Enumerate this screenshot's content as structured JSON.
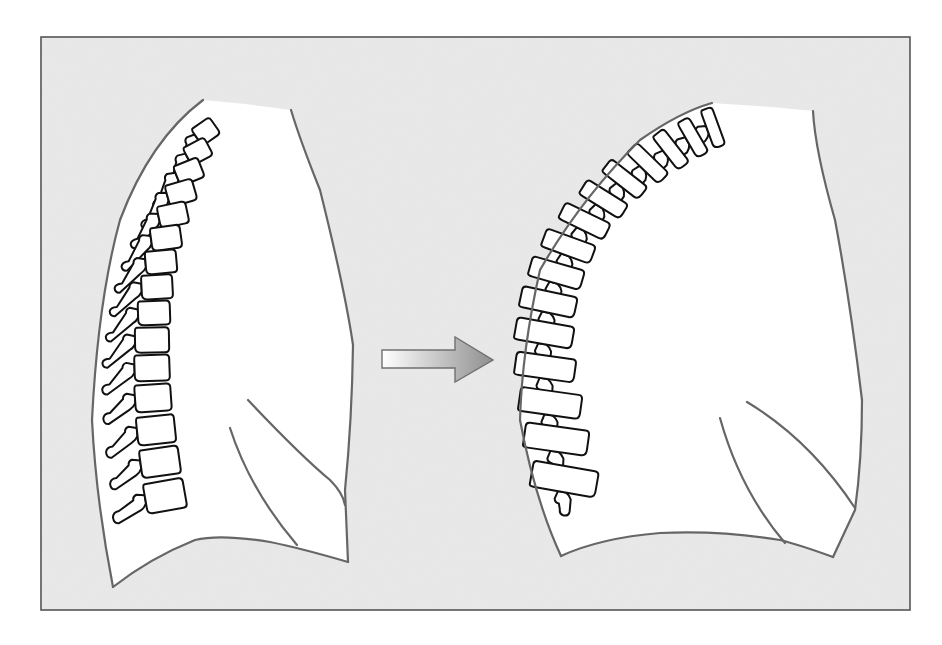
{
  "canvas": {
    "width": 942,
    "height": 645,
    "background": "#ffffff"
  },
  "frame": {
    "x": 41,
    "y": 37,
    "width": 869,
    "height": 573,
    "fill": "#e9e9e9",
    "stroke": "#555555"
  },
  "colors": {
    "torso_fill": "#ffffff",
    "outline_stroke": "#666666",
    "vertebra_stroke": "#111111",
    "arrow_start": "#ffffff",
    "arrow_end": "#8f8f8f",
    "arrow_stroke": "#707070"
  },
  "arrow": {
    "direction": "right",
    "shaft": {
      "x1": 382,
      "y1": 350,
      "x2": 455,
      "y2": 368
    },
    "head": {
      "base_x": 455,
      "top_y": 337,
      "bottom_y": 382,
      "tip_x": 493,
      "tip_y": 360
    }
  },
  "figures": [
    {
      "id": "normal-spine",
      "label": "",
      "torso": {
        "fill_path": "M203,100 Q250,104 291,110 Q300,140 320,190 Q345,290 353,345 Q352,420 345,490 L348,562 Q300,548 270,542 Q220,534 195,540 Q150,558 113,587 Q96,500 92,420 Q98,300 120,220 Q150,140 203,100 Z",
        "left_edge": "M203,100 Q150,140 120,220 Q98,300 92,420 Q96,500 113,587",
        "right_edge": "M291,110 Q300,140 320,190 Q345,290 353,345 Q352,420 345,490 L348,562",
        "bottom_edge": "M113,587 Q150,558 195,540 Q220,534 270,542 Q300,548 348,562"
      },
      "scapula_lines": [
        "M248,400 Q300,455 330,480 Q343,493 345,505",
        "M230,428 Q250,490 297,545"
      ],
      "vertebrae": [
        {
          "x": 205,
          "y": 132,
          "w": 24,
          "h": 20,
          "rot": -35,
          "px": -28,
          "py": 20,
          "pw": 22,
          "ph": 8
        },
        {
          "x": 197,
          "y": 152,
          "w": 26,
          "h": 20,
          "rot": -28,
          "px": -30,
          "py": 22,
          "pw": 24,
          "ph": 8
        },
        {
          "x": 188,
          "y": 172,
          "w": 28,
          "h": 21,
          "rot": -22,
          "px": -30,
          "py": 22,
          "pw": 24,
          "ph": 8
        },
        {
          "x": 180,
          "y": 193,
          "w": 30,
          "h": 22,
          "rot": -16,
          "px": -30,
          "py": 24,
          "pw": 24,
          "ph": 8
        },
        {
          "x": 172,
          "y": 215,
          "w": 31,
          "h": 22,
          "rot": -12,
          "px": -30,
          "py": 24,
          "pw": 24,
          "ph": 8
        },
        {
          "x": 165,
          "y": 238,
          "w": 32,
          "h": 23,
          "rot": -8,
          "px": -30,
          "py": 26,
          "pw": 24,
          "ph": 8
        },
        {
          "x": 160,
          "y": 262,
          "w": 33,
          "h": 23,
          "rot": -5,
          "px": -30,
          "py": 26,
          "pw": 24,
          "ph": 8
        },
        {
          "x": 156,
          "y": 287,
          "w": 33,
          "h": 24,
          "rot": -3,
          "px": -30,
          "py": 26,
          "pw": 22,
          "ph": 8
        },
        {
          "x": 153,
          "y": 313,
          "w": 34,
          "h": 24,
          "rot": -2,
          "px": -30,
          "py": 26,
          "pw": 22,
          "ph": 8
        },
        {
          "x": 151,
          "y": 340,
          "w": 36,
          "h": 25,
          "rot": -1,
          "px": -30,
          "py": 26,
          "pw": 22,
          "ph": 8
        },
        {
          "x": 151,
          "y": 368,
          "w": 37,
          "h": 26,
          "rot": -2,
          "px": -30,
          "py": 24,
          "pw": 22,
          "ph": 9
        },
        {
          "x": 152,
          "y": 398,
          "w": 38,
          "h": 27,
          "rot": -4,
          "px": -30,
          "py": 22,
          "pw": 20,
          "ph": 10
        },
        {
          "x": 155,
          "y": 430,
          "w": 40,
          "h": 28,
          "rot": -6,
          "px": -30,
          "py": 22,
          "pw": 20,
          "ph": 10
        },
        {
          "x": 159,
          "y": 462,
          "w": 41,
          "h": 28,
          "rot": -8,
          "px": -30,
          "py": 20,
          "pw": 20,
          "ph": 10
        },
        {
          "x": 164,
          "y": 496,
          "w": 42,
          "h": 30,
          "rot": -10,
          "px": -32,
          "py": 18,
          "pw": 20,
          "ph": 11
        }
      ]
    },
    {
      "id": "kyphotic-spine",
      "label": "",
      "torso": {
        "fill_path": "M712,103 Q765,106 813,111 Q815,150 835,220 Q850,300 862,400 Q862,460 855,510 L833,557 Q800,545 780,540 Q720,530 660,533 Q600,538 561,556 Q535,500 520,420 Q522,350 540,270 Q580,200 640,140 Q680,112 712,103 Z",
        "left_edge": "M712,103 Q680,112 640,140 Q580,200 540,270 Q522,350 520,420 Q535,500 561,556",
        "right_edge": "M813,111 Q815,150 835,220 Q850,300 862,400 Q862,460 855,510 L833,557",
        "bottom_edge": "M561,556 Q600,538 660,533 Q720,530 780,540 Q800,545 833,557"
      },
      "scapula_lines": [
        "M747,402 Q810,440 855,508",
        "M720,418 Q740,490 785,543"
      ],
      "vertebrae": [
        {
          "x": 712,
          "y": 128,
          "w": 14,
          "h": 40,
          "rot": -20,
          "px": -16,
          "py": 10,
          "pw": 12,
          "ph": 8
        },
        {
          "x": 692,
          "y": 138,
          "w": 15,
          "h": 40,
          "rot": -30,
          "px": -18,
          "py": 10,
          "pw": 12,
          "ph": 8
        },
        {
          "x": 670,
          "y": 150,
          "w": 16,
          "h": 42,
          "rot": -38,
          "px": -20,
          "py": 10,
          "pw": 12,
          "ph": 8
        },
        {
          "x": 647,
          "y": 164,
          "w": 17,
          "h": 44,
          "rot": -46,
          "px": -20,
          "py": 10,
          "pw": 12,
          "ph": 8
        },
        {
          "x": 624,
          "y": 180,
          "w": 18,
          "h": 46,
          "rot": -52,
          "px": -20,
          "py": 10,
          "pw": 12,
          "ph": 8
        },
        {
          "x": 603,
          "y": 200,
          "w": 19,
          "h": 48,
          "rot": -58,
          "px": -20,
          "py": 10,
          "pw": 12,
          "ph": 8
        },
        {
          "x": 584,
          "y": 222,
          "w": 20,
          "h": 50,
          "rot": -64,
          "px": -20,
          "py": 10,
          "pw": 12,
          "ph": 8
        },
        {
          "x": 568,
          "y": 247,
          "w": 21,
          "h": 52,
          "rot": -70,
          "px": -20,
          "py": 10,
          "pw": 12,
          "ph": 8
        },
        {
          "x": 556,
          "y": 274,
          "w": 22,
          "h": 54,
          "rot": -74,
          "px": -20,
          "py": 10,
          "pw": 12,
          "ph": 8
        },
        {
          "x": 548,
          "y": 303,
          "w": 23,
          "h": 56,
          "rot": -78,
          "px": -20,
          "py": 10,
          "pw": 12,
          "ph": 8
        },
        {
          "x": 544,
          "y": 334,
          "w": 24,
          "h": 58,
          "rot": -80,
          "px": -20,
          "py": 10,
          "pw": 12,
          "ph": 8
        },
        {
          "x": 545,
          "y": 368,
          "w": 25,
          "h": 60,
          "rot": -82,
          "px": -20,
          "py": 10,
          "pw": 12,
          "ph": 8
        },
        {
          "x": 550,
          "y": 404,
          "w": 26,
          "h": 62,
          "rot": -82,
          "px": -20,
          "py": 10,
          "pw": 12,
          "ph": 9
        },
        {
          "x": 556,
          "y": 440,
          "w": 27,
          "h": 64,
          "rot": -82,
          "px": -20,
          "py": 10,
          "pw": 12,
          "ph": 9
        },
        {
          "x": 564,
          "y": 480,
          "w": 28,
          "h": 66,
          "rot": -80,
          "px": -20,
          "py": 10,
          "pw": 12,
          "ph": 9
        }
      ]
    }
  ]
}
